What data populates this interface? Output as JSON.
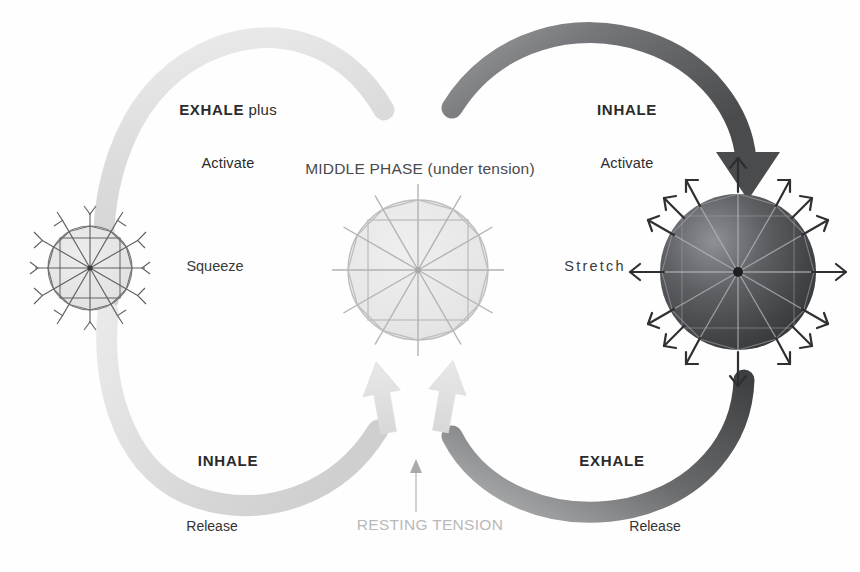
{
  "figure": {
    "caption": ""
  },
  "labels": {
    "top_left_primary": "EXHALE plus",
    "top_left_secondary": "Activate",
    "top_left_bold_part": "EXHALE",
    "top_left_light_part": " plus",
    "top_right_primary": "INHALE",
    "top_right_secondary": "Activate",
    "middle_phase": "MIDDLE PHASE (under tension)",
    "left_side": "Squeeze",
    "right_side": "Stretch",
    "bottom_left_primary": "INHALE",
    "bottom_left_secondary": "Release",
    "bottom_right_primary": "EXHALE",
    "bottom_right_secondary": "Release",
    "resting_tension": "RESTING TENSION"
  },
  "colors": {
    "dark_arc": "#58595b",
    "dark_arc_deep": "#3f4042",
    "light_arc": "#e2e2e2",
    "light_arc_mid": "#d4d4d4",
    "middle_sphere_fill": "#e8e8e8",
    "middle_sphere_line": "#b7b7b7",
    "left_sphere_fill": "#e6e6e6",
    "left_sphere_line": "#6e6e6e",
    "right_sphere_dark": "#3a3b3d",
    "right_sphere_light": "#8e9093",
    "text": "#2b2b2b",
    "muted_text": "#b9b9b9",
    "resting_arrow": "#c9c9c9"
  },
  "elements": {
    "left_sphere_name": "compressed-tensegrity-sphere",
    "middle_sphere_name": "neutral-tensegrity-sphere",
    "right_sphere_name": "expanded-tensegrity-sphere",
    "left_loop_name": "exhale-inhale-left-loop",
    "right_loop_name": "inhale-exhale-right-loop",
    "resting_arrow_name": "resting-tension-arrow",
    "middle_up_arrows_name": "middle-phase-up-arrows"
  },
  "geometry": {
    "left_sphere": {
      "cx": 90,
      "cy": 268,
      "r": 42
    },
    "middle_sphere": {
      "cx": 418,
      "cy": 270,
      "r": 70
    },
    "right_sphere": {
      "cx": 738,
      "cy": 272,
      "r": 78
    },
    "spoke_count": 12
  }
}
